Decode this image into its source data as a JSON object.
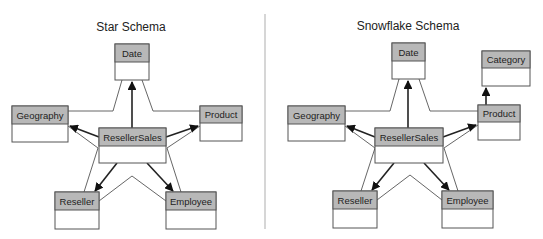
{
  "diagrams": [
    {
      "title": "Star Schema",
      "tables": {
        "date": "Date",
        "geography": "Geography",
        "product": "Product",
        "fact": "ResellerSales",
        "reseller": "Reseller",
        "employee": "Employee"
      },
      "relationships": [
        {
          "from": "ResellerSales",
          "to": "Date"
        },
        {
          "from": "ResellerSales",
          "to": "Geography"
        },
        {
          "from": "ResellerSales",
          "to": "Product"
        },
        {
          "from": "ResellerSales",
          "to": "Reseller"
        },
        {
          "from": "ResellerSales",
          "to": "Employee"
        }
      ]
    },
    {
      "title": "Snowflake Schema",
      "tables": {
        "date": "Date",
        "category": "Category",
        "geography": "Geography",
        "product": "Product",
        "fact": "ResellerSales",
        "reseller": "Reseller",
        "employee": "Employee"
      },
      "relationships": [
        {
          "from": "ResellerSales",
          "to": "Date"
        },
        {
          "from": "ResellerSales",
          "to": "Geography"
        },
        {
          "from": "ResellerSales",
          "to": "Product"
        },
        {
          "from": "ResellerSales",
          "to": "Reseller"
        },
        {
          "from": "ResellerSales",
          "to": "Employee"
        },
        {
          "from": "Product",
          "to": "Category"
        }
      ]
    }
  ]
}
